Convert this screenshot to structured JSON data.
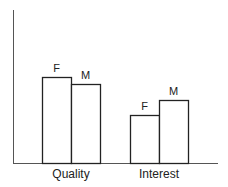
{
  "chart_data": {
    "type": "bar",
    "title": "",
    "xlabel": "",
    "ylabel": "",
    "categories": [
      "Quality",
      "Interest"
    ],
    "series": [
      {
        "name": "F",
        "values": [
          86,
          48
        ]
      },
      {
        "name": "M",
        "values": [
          79,
          63
        ]
      }
    ],
    "ylim": [
      0,
      153
    ],
    "units": "relative (no y tick labels shown)",
    "grid": false,
    "legend": "none (series labels F/M printed above bars)",
    "colors": {
      "bar_fill": "#ffffff",
      "bar_stroke": "#222222",
      "axis": "#555555"
    }
  }
}
